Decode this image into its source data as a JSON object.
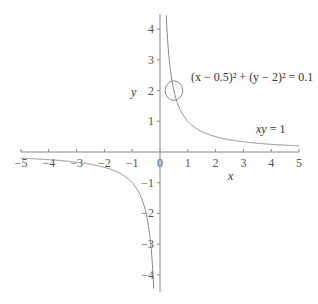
{
  "chart_data": {
    "type": "line",
    "title": "",
    "xlabel": "x",
    "ylabel": "y",
    "xlim": [
      -5,
      5
    ],
    "ylim": [
      -4.5,
      4.5
    ],
    "grid": false,
    "x_ticks": [
      "-5",
      "-4",
      "-3",
      "-2",
      "-1",
      "0",
      "1",
      "2",
      "3",
      "4",
      "5"
    ],
    "y_ticks": [
      "4",
      "3",
      "2",
      "1",
      "-1",
      "-2",
      "-3",
      "-4"
    ],
    "series": [
      {
        "name": "xy = 1",
        "type": "curve",
        "equation": "y = 1/x"
      },
      {
        "name": "(x − 0.5)² + (y − 2)² = 0.1",
        "type": "circle",
        "center": [
          0.5,
          2
        ],
        "radius_squared": 0.1
      }
    ],
    "annotations": [
      {
        "text": "xy = 1",
        "near": [
          4,
          0.7
        ]
      },
      {
        "text": "(x − 0.5)² + (y − 2)² = 0.1",
        "near": [
          2.5,
          2.4
        ]
      }
    ],
    "colors": {
      "axis": "#888888",
      "curve": "#888888",
      "text": "#333333"
    }
  },
  "labels": {
    "x_axis": "x",
    "y_axis": "y",
    "curve_eq_main": "xy",
    "curve_eq_rest": " = 1",
    "circle_eq": "(x − 0.5)² + (y − 2)² = 0.1"
  }
}
